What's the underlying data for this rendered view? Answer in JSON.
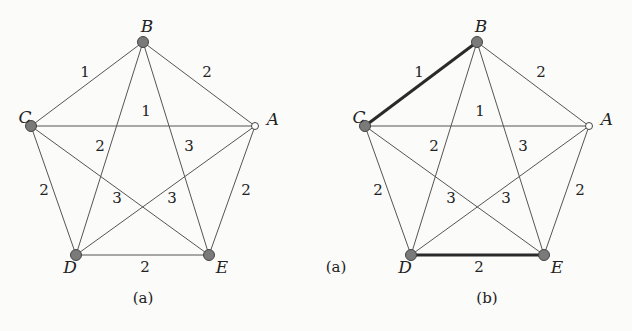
{
  "figure": {
    "panels": [
      {
        "id": "a",
        "caption": "(a)",
        "caption_pos": [
          143,
          299
        ],
        "nodes": [
          {
            "id": "A",
            "label": "A",
            "x": 255,
            "y": 126,
            "style": "hollow",
            "lx": 273,
            "ly": 120
          },
          {
            "id": "B",
            "label": "B",
            "x": 143,
            "y": 42,
            "style": "filled",
            "lx": 147,
            "ly": 27
          },
          {
            "id": "C",
            "label": "C",
            "x": 31,
            "y": 126,
            "style": "filled",
            "lx": 25,
            "ly": 118
          },
          {
            "id": "D",
            "label": "D",
            "x": 76,
            "y": 255,
            "style": "filled",
            "lx": 70,
            "ly": 268
          },
          {
            "id": "E",
            "label": "E",
            "x": 209,
            "y": 255,
            "style": "filled",
            "lx": 222,
            "ly": 268
          }
        ],
        "edges": [
          {
            "from": "C",
            "to": "B",
            "weight": "1",
            "lx": 85,
            "ly": 73,
            "bold": false
          },
          {
            "from": "B",
            "to": "A",
            "weight": "2",
            "lx": 207,
            "ly": 73,
            "bold": false
          },
          {
            "from": "C",
            "to": "A",
            "weight": "1",
            "lx": 146,
            "ly": 112,
            "bold": false
          },
          {
            "from": "B",
            "to": "D",
            "weight": "2",
            "lx": 100,
            "ly": 147,
            "bold": false
          },
          {
            "from": "B",
            "to": "E",
            "weight": "3",
            "lx": 189,
            "ly": 147,
            "bold": false
          },
          {
            "from": "C",
            "to": "D",
            "weight": "2",
            "lx": 44,
            "ly": 191,
            "bold": false
          },
          {
            "from": "A",
            "to": "E",
            "weight": "2",
            "lx": 246,
            "ly": 191,
            "bold": false
          },
          {
            "from": "C",
            "to": "E",
            "weight": "3",
            "lx": 117,
            "ly": 199,
            "bold": false
          },
          {
            "from": "A",
            "to": "D",
            "weight": "3",
            "lx": 172,
            "ly": 199,
            "bold": false
          },
          {
            "from": "D",
            "to": "E",
            "weight": "2",
            "lx": 145,
            "ly": 268,
            "bold": false
          }
        ]
      },
      {
        "id": "b",
        "caption": "(b)",
        "caption_pos": [
          487,
          299
        ],
        "side_label": "(a)",
        "side_label_pos": [
          336,
          268
        ],
        "nodes": [
          {
            "id": "A",
            "label": "A",
            "x": 589,
            "y": 126,
            "style": "hollow",
            "lx": 607,
            "ly": 120
          },
          {
            "id": "B",
            "label": "B",
            "x": 477,
            "y": 42,
            "style": "filled",
            "lx": 481,
            "ly": 27
          },
          {
            "id": "C",
            "label": "C",
            "x": 365,
            "y": 126,
            "style": "filled",
            "lx": 359,
            "ly": 118
          },
          {
            "id": "D",
            "label": "D",
            "x": 411,
            "y": 255,
            "style": "filled",
            "lx": 405,
            "ly": 268
          },
          {
            "id": "E",
            "label": "E",
            "x": 544,
            "y": 255,
            "style": "filled",
            "lx": 557,
            "ly": 268
          }
        ],
        "edges": [
          {
            "from": "C",
            "to": "B",
            "weight": "1",
            "lx": 419,
            "ly": 73,
            "bold": true
          },
          {
            "from": "B",
            "to": "A",
            "weight": "2",
            "lx": 541,
            "ly": 73,
            "bold": false
          },
          {
            "from": "C",
            "to": "A",
            "weight": "1",
            "lx": 480,
            "ly": 112,
            "bold": false
          },
          {
            "from": "B",
            "to": "D",
            "weight": "2",
            "lx": 434,
            "ly": 147,
            "bold": false
          },
          {
            "from": "B",
            "to": "E",
            "weight": "3",
            "lx": 523,
            "ly": 147,
            "bold": false
          },
          {
            "from": "C",
            "to": "D",
            "weight": "2",
            "lx": 378,
            "ly": 191,
            "bold": false
          },
          {
            "from": "A",
            "to": "E",
            "weight": "2",
            "lx": 580,
            "ly": 191,
            "bold": false
          },
          {
            "from": "C",
            "to": "E",
            "weight": "3",
            "lx": 451,
            "ly": 199,
            "bold": false
          },
          {
            "from": "A",
            "to": "D",
            "weight": "3",
            "lx": 506,
            "ly": 199,
            "bold": false
          },
          {
            "from": "D",
            "to": "E",
            "weight": "2",
            "lx": 479,
            "ly": 268,
            "bold": true
          }
        ]
      }
    ]
  }
}
